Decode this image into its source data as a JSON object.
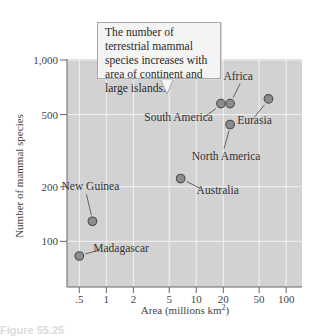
{
  "chart_data": {
    "type": "scatter",
    "title": "",
    "annotation": "The number of terrestrial mammal species increases with area of continent and large islands.",
    "xlabel": "Area (millions km²)",
    "ylabel": "Number of mammal species",
    "xscale": "log",
    "yscale": "log",
    "xlim": [
      0.35,
      140
    ],
    "ylim": [
      55,
      1000
    ],
    "x_ticks": [
      0.5,
      1,
      2,
      5,
      10,
      20,
      50,
      100
    ],
    "x_tick_labels": [
      ".5",
      "1",
      "2",
      "5",
      "10",
      "20",
      "50",
      "100"
    ],
    "y_ticks": [
      100,
      200,
      500,
      1000
    ],
    "y_tick_labels": [
      "100",
      "200",
      "500",
      "1,000"
    ],
    "grid": true,
    "legend": null,
    "points": [
      {
        "label": "Madagascar",
        "x": 0.5,
        "y": 83
      },
      {
        "label": "New Guinea",
        "x": 0.7,
        "y": 129
      },
      {
        "label": "Australia",
        "x": 6.7,
        "y": 222
      },
      {
        "label": "South America",
        "x": 18.8,
        "y": 575
      },
      {
        "label": "Africa",
        "x": 23.8,
        "y": 575
      },
      {
        "label": "North America",
        "x": 23.8,
        "y": 441
      },
      {
        "label": "Eurasia",
        "x": 63.6,
        "y": 610
      }
    ]
  },
  "labels": {
    "callout": "The number of terrestrial mammal species increases with area of continent and large islands.",
    "xlabel": "Area (millions km",
    "xlabel_sup": "2",
    "xlabel_end": ")",
    "ylabel": "Number of mammal species",
    "caption": "Figure 55.25"
  },
  "colors": {
    "plot_bg": "#d2d2d2",
    "gridline": "#f2f2f2",
    "point_fill": "#8c8c8c",
    "point_stroke": "#4a4a4a",
    "axis": "#666666"
  }
}
